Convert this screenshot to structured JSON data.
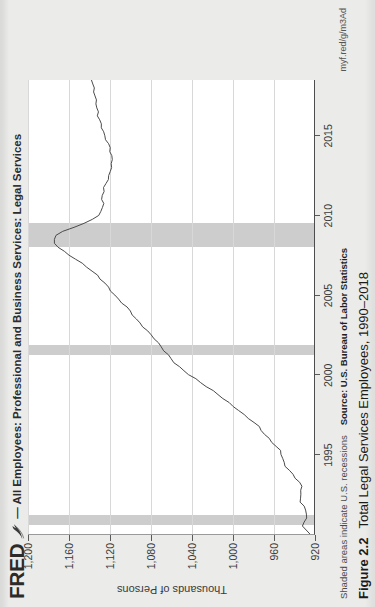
{
  "fred": {
    "logo_text": "FRED",
    "logo_mark": "swoosh-icon",
    "title": "— All Employees: Professional and Business Services: Legal Services"
  },
  "footer": {
    "note": "Shaded areas indicate U.S. recessions",
    "source": "Source: U.S. Bureau of Labor Statistics",
    "url": "myf.red/g/m3Ad"
  },
  "caption": {
    "number": "Figure 2.2",
    "text": "Total Legal Services Employees, 1990–2018"
  },
  "colors": {
    "series_line": "#4a4a4a",
    "recession_band": "#c9c9c9",
    "grid": "#d8d8d8",
    "axis": "#4d4d4d",
    "plot_bg": "#ffffff",
    "page_bg": "#ebebe9"
  },
  "chart_data": {
    "type": "line",
    "title": "All Employees: Professional and Business Services: Legal Services",
    "xlabel": "",
    "ylabel": "Thousands of Persons",
    "ylim": [
      920,
      1200
    ],
    "yticks": [
      920,
      960,
      1000,
      1040,
      1080,
      1120,
      1160,
      1200
    ],
    "ytick_labels": [
      "920",
      "960",
      "1,000",
      "1,040",
      "1,080",
      "1,120",
      "1,160",
      "1,200"
    ],
    "xlim": [
      1990,
      2018.5
    ],
    "xticks": [
      1995,
      2000,
      2005,
      2010,
      2015
    ],
    "xtick_labels": [
      "1995",
      "2000",
      "2005",
      "2010",
      "2015"
    ],
    "grid": true,
    "legend": "none",
    "series": [
      {
        "name": "All Employees: Legal Services (Thousands of Persons)",
        "x": [
          1990.0,
          1990.25,
          1990.5,
          1990.75,
          1991.0,
          1991.25,
          1991.5,
          1991.75,
          1992.0,
          1992.25,
          1992.5,
          1992.75,
          1993.0,
          1993.25,
          1993.5,
          1993.75,
          1994.0,
          1994.25,
          1994.5,
          1994.75,
          1995.0,
          1995.25,
          1995.5,
          1995.75,
          1996.0,
          1996.25,
          1996.5,
          1996.75,
          1997.0,
          1997.25,
          1997.5,
          1997.75,
          1998.0,
          1998.25,
          1998.5,
          1998.75,
          1999.0,
          1999.25,
          1999.5,
          1999.75,
          2000.0,
          2000.25,
          2000.5,
          2000.75,
          2001.0,
          2001.25,
          2001.5,
          2001.75,
          2002.0,
          2002.25,
          2002.5,
          2002.75,
          2003.0,
          2003.25,
          2003.5,
          2003.75,
          2004.0,
          2004.25,
          2004.5,
          2004.75,
          2005.0,
          2005.25,
          2005.5,
          2005.75,
          2006.0,
          2006.25,
          2006.5,
          2006.75,
          2007.0,
          2007.25,
          2007.5,
          2007.75,
          2008.0,
          2008.25,
          2008.5,
          2008.75,
          2009.0,
          2009.25,
          2009.5,
          2009.75,
          2010.0,
          2010.25,
          2010.5,
          2010.75,
          2011.0,
          2011.25,
          2011.5,
          2011.75,
          2012.0,
          2012.25,
          2012.5,
          2012.75,
          2013.0,
          2013.25,
          2013.5,
          2013.75,
          2014.0,
          2014.25,
          2014.5,
          2014.75,
          2015.0,
          2015.25,
          2015.5,
          2015.75,
          2016.0,
          2016.25,
          2016.5,
          2016.75,
          2017.0,
          2017.25,
          2017.5,
          2017.75,
          2018.0,
          2018.25,
          2018.5
        ],
        "y": [
          924,
          928,
          930,
          929,
          927,
          926,
          928,
          930,
          933,
          934,
          934,
          933,
          933,
          935,
          938,
          941,
          944,
          947,
          949,
          950,
          951,
          953,
          957,
          961,
          965,
          969,
          972,
          975,
          979,
          984,
          989,
          993,
          998,
          1003,
          1008,
          1013,
          1019,
          1025,
          1031,
          1037,
          1043,
          1048,
          1053,
          1057,
          1060,
          1063,
          1066,
          1069,
          1072,
          1075,
          1079,
          1083,
          1087,
          1091,
          1095,
          1098,
          1101,
          1104,
          1108,
          1112,
          1115,
          1118,
          1121,
          1124,
          1128,
          1132,
          1137,
          1142,
          1148,
          1154,
          1160,
          1166,
          1171,
          1174,
          1175,
          1172,
          1165,
          1155,
          1144,
          1136,
          1131,
          1128,
          1127,
          1127,
          1128,
          1128,
          1127,
          1126,
          1124,
          1122,
          1120,
          1119,
          1118,
          1117,
          1117,
          1118,
          1119,
          1120,
          1122,
          1124,
          1126,
          1127,
          1128,
          1129,
          1130,
          1131,
          1131,
          1132,
          1132,
          1133,
          1134,
          1135,
          1136,
          1137,
          1138
        ]
      }
    ],
    "recessions": [
      {
        "start": 1990.55,
        "end": 1991.2
      },
      {
        "start": 2001.2,
        "end": 2001.85
      },
      {
        "start": 2007.95,
        "end": 2009.45
      }
    ],
    "annotations": [
      "Shaded areas indicate U.S. recessions"
    ]
  }
}
